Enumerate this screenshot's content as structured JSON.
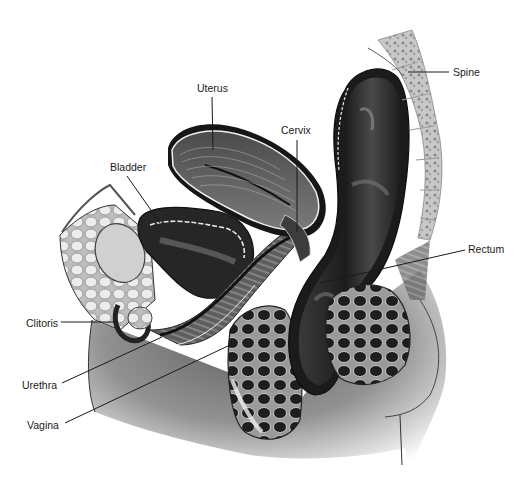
{
  "diagram": {
    "type": "anatomical-cross-section",
    "colors": {
      "background": "#ffffff",
      "ink": "#1a1a1a",
      "dark_tissue": "#2a2a2a",
      "mid_tissue": "#6e6e6e",
      "light_tissue": "#d6d6d6",
      "skin_shadow": "#8a8a8a"
    },
    "labels": [
      {
        "id": "uterus",
        "text": "Uterus"
      },
      {
        "id": "bladder",
        "text": "Bladder"
      },
      {
        "id": "cervix",
        "text": "Cervix"
      },
      {
        "id": "spine",
        "text": "Spine"
      },
      {
        "id": "rectum",
        "text": "Rectum"
      },
      {
        "id": "clitoris",
        "text": "Clitoris"
      },
      {
        "id": "urethra",
        "text": "Urethra"
      },
      {
        "id": "vagina",
        "text": "Vagina"
      }
    ]
  }
}
